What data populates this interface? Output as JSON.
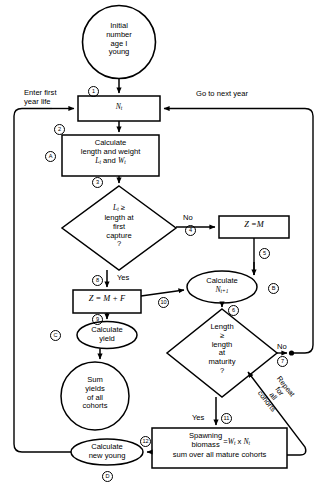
{
  "diagram": {
    "type": "flowchart",
    "nodes": {
      "start_circle": {
        "shape": "circle",
        "lines": [
          "Initial",
          "number",
          "age I",
          "young"
        ]
      },
      "nt_box": {
        "shape": "rect",
        "text": "N",
        "sub": "t"
      },
      "calc_length_weight": {
        "shape": "rect",
        "lines": [
          "Calculate",
          "length and weight"
        ],
        "formula_prefix": "L",
        "formula_sub1": "t",
        "formula_mid": " and  ",
        "formula_prefix2": "W",
        "formula_sub2": "t"
      },
      "decision_capture": {
        "shape": "diamond",
        "lines": [
          "L",
          "length at",
          "first",
          "capture",
          "?"
        ],
        "line1_var": "L",
        "line1_sub": "t",
        "line1_op": " ≥"
      },
      "z_equals_m": {
        "shape": "rect",
        "text": "Z =M"
      },
      "z_equals_m_plus_f": {
        "shape": "rect",
        "text": "Z = M + F"
      },
      "calc_ntplus1": {
        "shape": "ellipse",
        "lines": [
          "Calculate"
        ],
        "formula_var": "N",
        "formula_sub": "t+1"
      },
      "decision_maturity": {
        "shape": "diamond",
        "lines": [
          "Length",
          "≥",
          "length",
          "at",
          "maturity",
          "?"
        ]
      },
      "calc_yield": {
        "shape": "ellipse",
        "lines": [
          "Calculate",
          "yield"
        ]
      },
      "sum_yields": {
        "shape": "circle",
        "lines": [
          "Sum",
          "yields",
          "of all",
          "cohorts"
        ]
      },
      "spawning_biomass": {
        "shape": "rect",
        "line1": "Spawning",
        "line2": "biomass",
        "eq": "=",
        "rhs_var1": "W",
        "rhs_sub1": "t",
        "rhs_mid": " x ",
        "rhs_var2": "N",
        "rhs_sub2": "t",
        "line3": "sum over all mature cohorts"
      },
      "calc_new_young": {
        "shape": "ellipse",
        "lines": [
          "Calculate",
          "new young"
        ]
      }
    },
    "edge_labels": {
      "enter_first_year": [
        "Enter first",
        "year life"
      ],
      "go_to_next_year": "Go to next year",
      "no_capture": "No",
      "yes_capture": "Yes",
      "no_maturity": "No",
      "yes_maturity": "Yes",
      "repeat_for_all_cohorts": [
        "Repeat",
        "for",
        "all",
        "cohorts"
      ]
    },
    "step_markers": {
      "m1": "1",
      "m2": "2",
      "m3": "3",
      "m4": "4",
      "m5": "5",
      "m6": "6",
      "m7": "7",
      "m8": "8",
      "m9": "9",
      "m10": "10",
      "m11": "11",
      "m12": "12"
    },
    "letter_markers": {
      "a": "A",
      "b": "B",
      "c": "C",
      "d": "D"
    }
  }
}
